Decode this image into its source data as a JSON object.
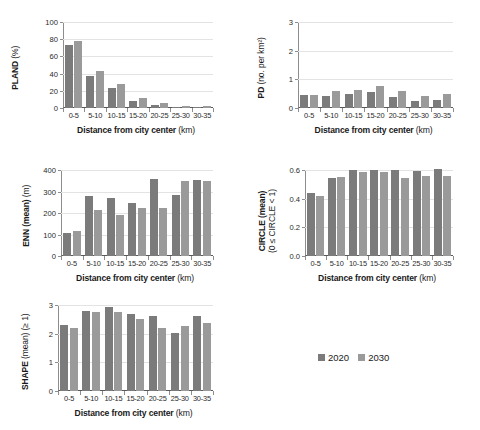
{
  "figure": {
    "legend": {
      "series": [
        {
          "label": "2020",
          "color": "#7b7b7b"
        },
        {
          "label": "2030",
          "color": "#9a9a9a"
        }
      ]
    },
    "xlabel_main": "Distance from city center",
    "xlabel_unit": "(km)"
  },
  "chart_data": [
    {
      "type": "bar",
      "id": "pland",
      "title": "",
      "xlabel": "Distance from city center (km)",
      "ylabel": "PLAND (%)",
      "ylabel_bold": "PLAND",
      "ylabel_thin": "(%)",
      "categories": [
        "0-5",
        "5-10",
        "10-15",
        "15-20",
        "20-25",
        "25-30",
        "30-35"
      ],
      "ylim": [
        0,
        100
      ],
      "yticks": [
        0,
        20,
        40,
        60,
        80,
        100
      ],
      "ytick_labels": [
        "0",
        "20",
        "40",
        "60",
        "80",
        "100"
      ],
      "grid": true,
      "legend_position": "external-bottom-right",
      "series": [
        {
          "name": "2020",
          "values": [
            73,
            37,
            23,
            8.5,
            4,
            1.2,
            1
          ]
        },
        {
          "name": "2030",
          "values": [
            78,
            42.5,
            28,
            11.5,
            6,
            2.5,
            2.3
          ]
        }
      ]
    },
    {
      "type": "bar",
      "id": "pd",
      "title": "",
      "xlabel": "Distance from city center (km)",
      "ylabel": "PD (no. per km²)",
      "ylabel_bold": "PD",
      "ylabel_thin": "(no. per km²)",
      "categories": [
        "0-5",
        "5-10",
        "10-15",
        "15-20",
        "20-25",
        "25-30",
        "30-35"
      ],
      "ylim": [
        0,
        3
      ],
      "yticks": [
        0,
        1,
        2,
        3
      ],
      "ytick_labels": [
        "0",
        "1",
        "2",
        "3"
      ],
      "grid": true,
      "series": [
        {
          "name": "2020",
          "values": [
            0.46,
            0.42,
            0.49,
            0.56,
            0.38,
            0.23,
            0.29
          ]
        },
        {
          "name": "2030",
          "values": [
            0.46,
            0.59,
            0.62,
            0.76,
            0.61,
            0.42,
            0.5
          ]
        }
      ]
    },
    {
      "type": "bar",
      "id": "enn",
      "title": "",
      "xlabel": "Distance from city center (km)",
      "ylabel": "ENN (mean) (m)",
      "ylabel_bold": "ENN (mean)",
      "ylabel_thin": "(m)",
      "categories": [
        "0-5",
        "5-10",
        "10-15",
        "15-20",
        "20-25",
        "25-30",
        "30-35"
      ],
      "ylim": [
        0,
        400
      ],
      "yticks": [
        0,
        100,
        200,
        300,
        400
      ],
      "ytick_labels": [
        "0",
        "100",
        "200",
        "300",
        "400"
      ],
      "grid": true,
      "series": [
        {
          "name": "2020",
          "values": [
            108,
            281,
            268,
            248,
            356,
            282,
            353
          ]
        },
        {
          "name": "2030",
          "values": [
            116,
            213,
            189,
            224,
            224,
            349,
            350
          ]
        }
      ]
    },
    {
      "type": "bar",
      "id": "circle",
      "title": "",
      "xlabel": "Distance from city center (km)",
      "ylabel": "CIRCLE (mean) (0 ≤ CIRCLE < 1)",
      "ylabel_line1": "CIRCLE (mean)",
      "ylabel_line2": "(0 ≤ CIRCLE < 1)",
      "categories": [
        "0-5",
        "5-10",
        "10-15",
        "15-20",
        "20-25",
        "25-30",
        "30-35"
      ],
      "ylim": [
        0,
        0.6
      ],
      "yticks": [
        0,
        0.2,
        0.4,
        0.6
      ],
      "ytick_labels": [
        "0.0",
        "0.2",
        "0.4",
        "0.6"
      ],
      "grid": true,
      "series": [
        {
          "name": "2020",
          "values": [
            0.44,
            0.545,
            0.6,
            0.597,
            0.6,
            0.591,
            0.605
          ]
        },
        {
          "name": "2030",
          "values": [
            0.418,
            0.548,
            0.585,
            0.588,
            0.546,
            0.559,
            0.558
          ]
        }
      ]
    },
    {
      "type": "bar",
      "id": "shape",
      "title": "",
      "xlabel": "Distance from city center (km)",
      "ylabel": "SHAPE (mean) (≥ 1)",
      "ylabel_bold": "SHAPE",
      "ylabel_thin": "(mean) (≥ 1)",
      "categories": [
        "0-5",
        "5-10",
        "10-15",
        "15-20",
        "20-25",
        "25-30",
        "30-35"
      ],
      "ylim": [
        0,
        3
      ],
      "yticks": [
        0,
        1,
        2,
        3
      ],
      "ytick_labels": [
        "0",
        "1",
        "2",
        "3"
      ],
      "grid": true,
      "series": [
        {
          "name": "2020",
          "values": [
            2.31,
            2.78,
            2.93,
            2.67,
            2.63,
            2.03,
            2.63
          ]
        },
        {
          "name": "2030",
          "values": [
            2.19,
            2.74,
            2.74,
            2.5,
            2.19,
            2.26,
            2.38
          ]
        }
      ]
    }
  ]
}
